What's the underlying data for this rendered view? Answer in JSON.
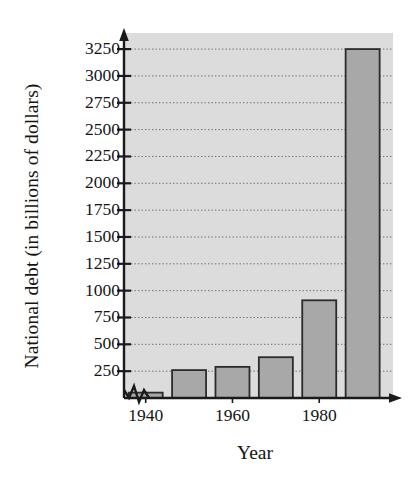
{
  "chart_data": {
    "type": "bar",
    "title": "",
    "subtitle": "",
    "xlabel": "Year",
    "ylabel": "National debt (in billions of dollars)",
    "categories": [
      "1940",
      "1950",
      "1960",
      "1970",
      "1980",
      "1990"
    ],
    "values": [
      50,
      260,
      290,
      380,
      910,
      3250
    ],
    "x": [
      1940,
      1950,
      1960,
      1970,
      1980,
      1990
    ],
    "series": [
      {
        "name": "National debt",
        "values": [
          50,
          260,
          290,
          380,
          910,
          3250
        ]
      }
    ],
    "ylim": [
      0,
      3400
    ],
    "xlim": [
      1935,
      1997
    ],
    "y_ticks": [
      250,
      500,
      750,
      1000,
      1250,
      1500,
      1750,
      2000,
      2250,
      2500,
      2750,
      3000,
      3250
    ],
    "y_tick_labels": [
      "250",
      "500",
      "750",
      "1000",
      "1250",
      "1500",
      "1750",
      "2000",
      "2250",
      "2500",
      "2750",
      "3000",
      "3250"
    ],
    "x_ticks": [
      1940,
      1960,
      1980
    ],
    "x_tick_labels": [
      "1940",
      "1960",
      "1980"
    ],
    "grid": true,
    "grid_style": "dotted-horizontal",
    "legend": false,
    "legend_position": "none",
    "axis_break": true,
    "axis_break_note": "zigzag break on horizontal axis at left of first bar",
    "annotations": [],
    "colors": {
      "plot_background": "#dcdcdc",
      "bar_fill": "#a8a8a8",
      "bar_stroke": "#2b2b2b",
      "axis": "#1a1a1a",
      "gridline": "#6e6e6e",
      "text": "#141414",
      "page_background": "#ffffff"
    }
  }
}
